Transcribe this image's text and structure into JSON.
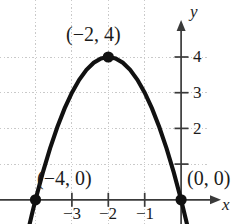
{
  "figure": {
    "kind": "math-graph",
    "background_color": "#ffffff",
    "curve_color": "#111111",
    "grid_color": "#c9c9c9",
    "axis_color": "#3a3a3a",
    "text_color": "#1b1b1b"
  },
  "axes": {
    "x_label": "x",
    "y_label": "y",
    "x_ticks": [
      {
        "value": -3,
        "label": "−3"
      },
      {
        "value": -2,
        "label": "−2"
      },
      {
        "value": -1,
        "label": "−1"
      }
    ],
    "y_ticks": [
      {
        "value": 4,
        "label": "4"
      },
      {
        "value": 3,
        "label": "3"
      },
      {
        "value": 2,
        "label": "2"
      },
      {
        "value": 1,
        "label": ""
      }
    ]
  },
  "annotations": [
    {
      "name": "vertex",
      "label": "(−2, 4)",
      "x": -2,
      "y": 4
    },
    {
      "name": "x-intercept-left",
      "label": "(−4, 0)",
      "x": -4,
      "y": 0
    },
    {
      "name": "origin-intercept",
      "label": "(0, 0)",
      "x": 0,
      "y": 0
    }
  ],
  "chart_data": {
    "type": "line",
    "title": "",
    "xlabel": "x",
    "ylabel": "y",
    "grid": true,
    "legend": "none",
    "equation": "y = -(x + 2)^2 + 4",
    "xlim": [
      -4.95,
      0.85
    ],
    "ylim": [
      -0.85,
      4.95
    ],
    "x": [
      -4.9,
      -4.7,
      -4.5,
      -4.3,
      -4.1,
      -4.0,
      -3.8,
      -3.6,
      -3.4,
      -3.2,
      -3.0,
      -2.8,
      -2.6,
      -2.4,
      -2.2,
      -2.0,
      -1.8,
      -1.6,
      -1.4,
      -1.2,
      -1.0,
      -0.8,
      -0.6,
      -0.4,
      -0.2,
      0.0,
      0.2,
      0.4,
      0.6,
      0.8
    ],
    "y": [
      -4.41,
      -3.29,
      -2.25,
      -1.29,
      -0.41,
      0.0,
      0.76,
      1.44,
      2.04,
      2.56,
      3.0,
      3.36,
      3.64,
      3.84,
      3.96,
      4.0,
      3.96,
      3.84,
      3.64,
      3.36,
      3.0,
      2.56,
      2.04,
      1.44,
      0.76,
      0.0,
      -0.84,
      -1.76,
      -2.76,
      -3.84
    ],
    "points": [
      {
        "label": "(−2, 4)",
        "x": -2,
        "y": 4
      },
      {
        "label": "(−4, 0)",
        "x": -4,
        "y": 0
      },
      {
        "label": "(0, 0)",
        "x": 0,
        "y": 0
      }
    ],
    "xticks": [
      -3,
      -2,
      -1
    ],
    "xticklabels": [
      "−3",
      "−2",
      "−1"
    ],
    "yticks": [
      1,
      2,
      3,
      4
    ],
    "yticklabels": [
      "",
      "2",
      "3",
      "4"
    ]
  }
}
